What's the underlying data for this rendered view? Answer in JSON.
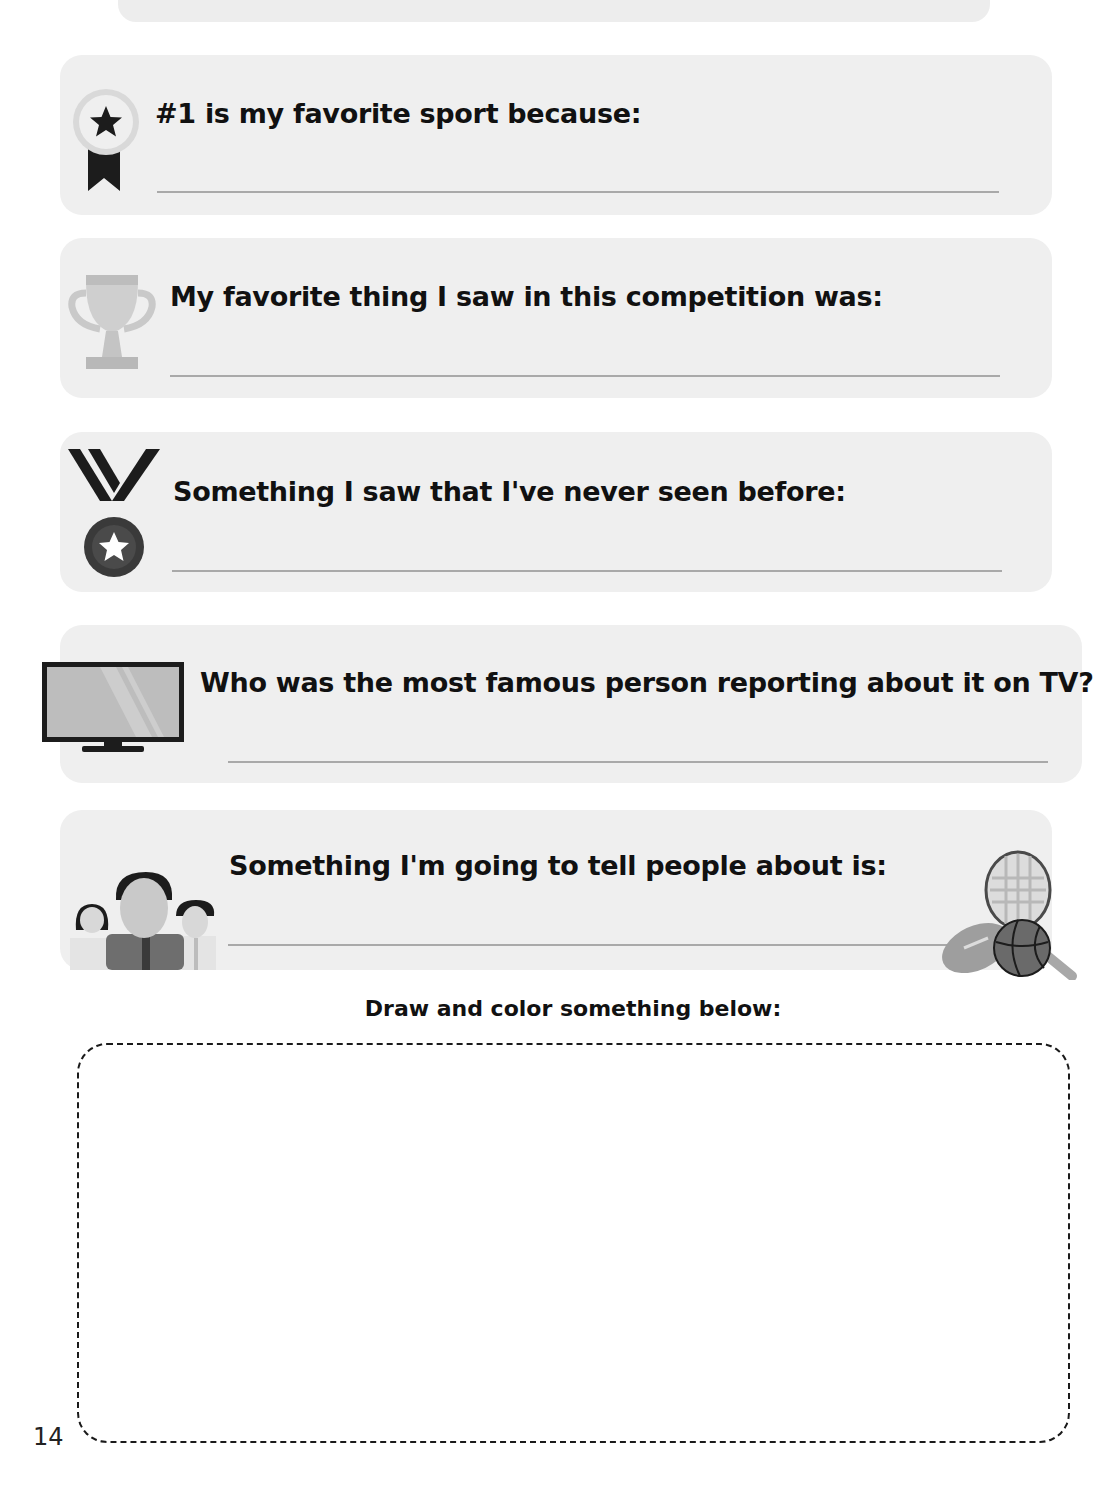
{
  "questions": [
    {
      "id": "favorite-sport",
      "icon": "award-ribbon-icon",
      "prompt": "#1 is my favorite sport because:",
      "answer": ""
    },
    {
      "id": "favorite-thing",
      "icon": "trophy-icon",
      "prompt": "My favorite thing I saw in this competition was:",
      "answer": ""
    },
    {
      "id": "never-seen",
      "icon": "medal-icon",
      "prompt": "Something I saw that I've never seen before:",
      "answer": ""
    },
    {
      "id": "famous-reporter",
      "icon": "tv-icon",
      "prompt": "Who was the most famous person reporting about it on TV?",
      "answer": ""
    },
    {
      "id": "tell-people",
      "icon": "people-icon",
      "prompt": "Something I'm going to tell people about is:",
      "answer": ""
    }
  ],
  "drawing": {
    "label": "Draw and color something below:"
  },
  "page_number": "14",
  "colors": {
    "panel_bg": "#efefef",
    "text": "#111111",
    "answer_line": "#a9a9a9"
  }
}
